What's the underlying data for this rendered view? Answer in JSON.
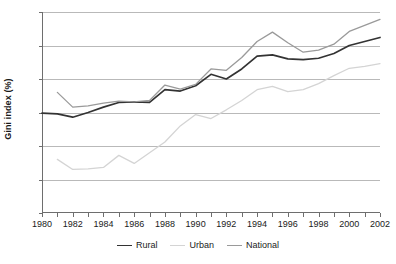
{
  "chart_data": {
    "type": "line",
    "title": "",
    "xlabel": "",
    "ylabel": "Gini index (%)",
    "ylim": [
      10,
      40
    ],
    "xlim": [
      1980,
      2002
    ],
    "ytick_labels": [
      "10",
      "15",
      "20",
      "25",
      "30",
      "35",
      "40"
    ],
    "yticks": [
      10,
      15,
      20,
      25,
      30,
      35,
      40
    ],
    "xtick_labels": [
      "1980",
      "1982",
      "1984",
      "1986",
      "1988",
      "1990",
      "1992",
      "1994",
      "1996",
      "1998",
      "2000",
      "2002"
    ],
    "xticks": [
      1980,
      1982,
      1984,
      1986,
      1988,
      1990,
      1992,
      1994,
      1996,
      1998,
      2000,
      2002
    ],
    "x": [
      1980,
      1981,
      1982,
      1983,
      1984,
      1985,
      1986,
      1987,
      1988,
      1989,
      1990,
      1991,
      1992,
      1993,
      1994,
      1995,
      1996,
      1997,
      1998,
      1999,
      2000,
      2001,
      2002
    ],
    "grid": "horizontal",
    "legend_position": "bottom",
    "series": [
      {
        "name": "Rural",
        "color": "#333333",
        "values": [
          24.9,
          24.8,
          24.3,
          25.0,
          25.8,
          26.5,
          26.6,
          26.5,
          28.4,
          28.2,
          29.0,
          30.7,
          30.0,
          31.5,
          33.4,
          33.6,
          33.0,
          32.9,
          33.1,
          33.8,
          35.0,
          35.6,
          36.2
        ]
      },
      {
        "name": "Urban",
        "color": "#d4d4d4",
        "values": [
          null,
          18.0,
          16.5,
          16.6,
          16.8,
          18.6,
          17.4,
          19.0,
          20.6,
          23.0,
          24.7,
          24.1,
          25.4,
          26.8,
          28.4,
          28.9,
          28.1,
          28.4,
          29.3,
          30.5,
          31.6,
          31.9,
          32.3
        ]
      },
      {
        "name": "National",
        "color": "#9a9a9a",
        "values": [
          null,
          28.0,
          25.8,
          26.0,
          26.4,
          26.7,
          26.6,
          26.8,
          29.1,
          28.5,
          29.2,
          31.5,
          31.3,
          33.2,
          35.6,
          37.0,
          35.4,
          34.0,
          34.3,
          35.2,
          37.1,
          38.0,
          38.9
        ]
      }
    ]
  },
  "legend": {
    "items": [
      {
        "label": "Rural",
        "color": "#333333"
      },
      {
        "label": "Urban",
        "color": "#d4d4d4"
      },
      {
        "label": "National",
        "color": "#9a9a9a"
      }
    ]
  }
}
